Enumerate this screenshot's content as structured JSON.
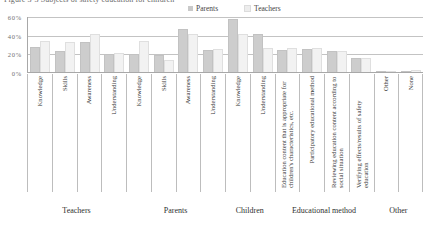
{
  "chart": {
    "title": "Figure 3-3  Subjects of safety education for children",
    "legend": [
      {
        "label": "Parents",
        "color": "#cdcdcd"
      },
      {
        "label": "Teachers",
        "color": "#f2f2f2"
      }
    ]
  },
  "chart_data": {
    "type": "bar",
    "title": "Figure 3-3  Subjects of safety education for children",
    "xlabel": "",
    "ylabel": "",
    "ylim": [
      0,
      60
    ],
    "grid": true,
    "legend_position": "top",
    "tick_labels": [
      "0%",
      "20%",
      "40%",
      "60%"
    ],
    "tick_values": [
      0,
      20,
      40,
      60
    ],
    "categories": [
      "Knowledge",
      "Skills",
      "Awareness",
      "Understanding",
      "Knowledge",
      "Skills",
      "Awareness",
      "Understanding",
      "Knowledge",
      "Understanding",
      "Education content that is appropriate for children's characteristics, etc.",
      "Participatory educational method",
      "Reviewing education content according to social situation",
      "Verifying effects/results of safety education",
      "Other",
      "None"
    ],
    "series": [
      {
        "name": "Parents",
        "values": [
          27,
          22,
          32,
          19,
          19,
          18,
          46,
          24,
          57,
          41,
          24,
          25,
          23,
          15,
          0.5,
          0
        ]
      },
      {
        "name": "Teachers",
        "values": [
          33,
          32,
          41,
          20,
          33,
          13,
          41,
          25,
          41,
          26,
          26,
          26,
          23,
          15,
          0,
          2
        ]
      }
    ],
    "groups": [
      {
        "label": "Teachers",
        "span": 4
      },
      {
        "label": "Parents",
        "span": 4
      },
      {
        "label": "Children",
        "span": 2
      },
      {
        "label": "Educational method",
        "span": 4
      },
      {
        "label": "Other",
        "span": 2
      }
    ]
  }
}
